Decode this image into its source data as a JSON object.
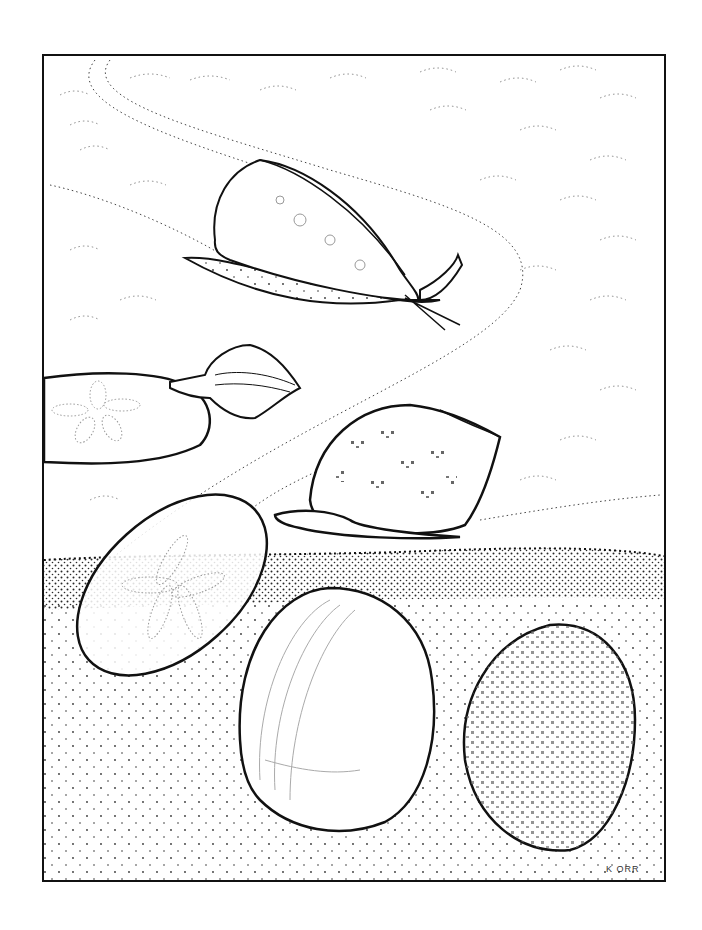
{
  "illustration": {
    "subject": "seashells and sand dollars on the shore",
    "signature": "K ORR",
    "colors": {
      "ink": "#111111",
      "paper": "#ffffff",
      "dots": "#555555"
    },
    "elements": [
      {
        "name": "cone-snail",
        "label": "Cone snail"
      },
      {
        "name": "murex-snail",
        "label": "Murex snail"
      },
      {
        "name": "sand-dollar-top",
        "label": "Sand dollar"
      },
      {
        "name": "tun-shell",
        "label": "Tun shell snail"
      },
      {
        "name": "sand-dollar-bottom",
        "label": "Sand dollar"
      },
      {
        "name": "clam-shell",
        "label": "Clam shell"
      },
      {
        "name": "speckled-clam",
        "label": "Speckled clam shell"
      }
    ]
  }
}
